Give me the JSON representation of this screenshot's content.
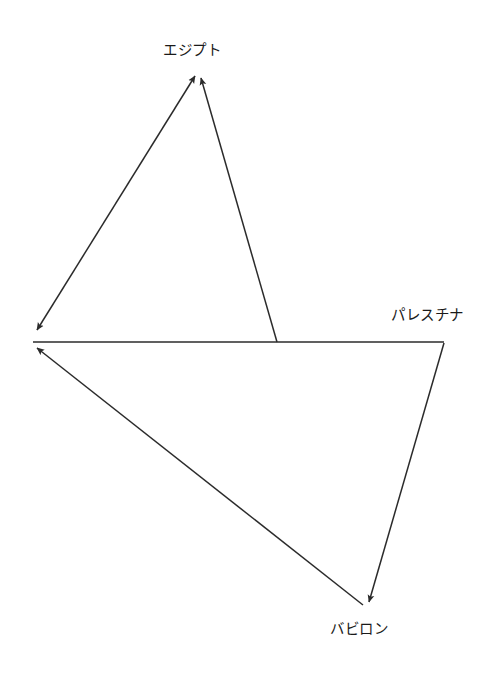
{
  "figure": {
    "type": "directed-graph-diagram",
    "background_color": "#ffffff",
    "line_color": "#2b2b2b",
    "text_color": "#1a1a1a"
  },
  "nodes": [
    {
      "id": "egypt",
      "label": "エジプト",
      "x": 198,
      "y": 73
    },
    {
      "id": "palestine",
      "label": "パレスチナ",
      "x": 444,
      "y": 342
    },
    {
      "id": "babylon",
      "label": "バビロン",
      "x": 368,
      "y": 607
    },
    {
      "id": "junction",
      "label": "",
      "x": 33,
      "y": 341
    }
  ],
  "edges": [
    {
      "id": "edge-junction-egypt",
      "from": "junction",
      "to": "egypt",
      "arrowheads": "both",
      "description": "double-headed diagonal between left junction and Egypt apex"
    },
    {
      "id": "edge-baseline-egypt",
      "from": "baseline-midpoint",
      "to": "egypt",
      "arrowheads": "end",
      "description": "steep line rising from the horizontal baseline up to Egypt apex"
    },
    {
      "id": "edge-palestine-junction",
      "from": "palestine",
      "to": "junction",
      "arrowheads": "none",
      "description": "horizontal baseline from Palestine corner to left junction"
    },
    {
      "id": "edge-palestine-babylon",
      "from": "palestine",
      "to": "babylon",
      "arrowheads": "end",
      "description": "descending line from Palestine corner to Babylon"
    },
    {
      "id": "edge-babylon-junction",
      "from": "babylon",
      "to": "junction",
      "arrowheads": "end",
      "description": "long diagonal from Babylon back up-left to the junction"
    }
  ],
  "geometry": {
    "baseline_y": 342,
    "baseline_x_start": 33,
    "baseline_x_end": 444,
    "baseline_branch_x": 277,
    "arrow_tip_upper_left": {
      "x": 35,
      "y": 332
    },
    "arrow_tip_lower_left": {
      "x": 33,
      "y": 349
    },
    "arrow_tip_apex": {
      "x": 198,
      "y": 73
    },
    "arrow_tip_babylon": {
      "x": 368,
      "y": 607
    }
  }
}
